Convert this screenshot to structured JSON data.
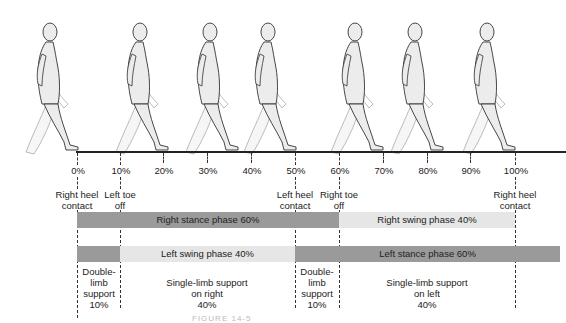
{
  "diagram": {
    "figure_count": 9,
    "timeline": {
      "ticks": [
        {
          "label": "0%",
          "x": 77
        },
        {
          "label": "10%",
          "x": 120
        },
        {
          "label": "20%",
          "x": 163
        },
        {
          "label": "30%",
          "x": 207
        },
        {
          "label": "40%",
          "x": 251
        },
        {
          "label": "50%",
          "x": 295
        },
        {
          "label": "60%",
          "x": 339
        },
        {
          "label": "70%",
          "x": 383
        },
        {
          "label": "80%",
          "x": 427
        },
        {
          "label": "90%",
          "x": 470
        },
        {
          "label": "100%",
          "x": 515
        }
      ]
    },
    "events": [
      {
        "line1": "Right heel",
        "line2": "contact",
        "at": "0%"
      },
      {
        "line1": "Left toe",
        "line2": "off",
        "at": "10%"
      },
      {
        "line1": "Left heel",
        "line2": "contact",
        "at": "50%"
      },
      {
        "line1": "Right toe",
        "line2": "off",
        "at": "60%"
      },
      {
        "line1": "Right heel",
        "line2": "contact",
        "at": "100%"
      }
    ],
    "phases": {
      "right_stance": "Right stance phase 60%",
      "right_swing": "Right swing phase 40%",
      "left_swing": "Left swing phase 40%",
      "left_stance": "Left stance phase 60%"
    },
    "support": [
      {
        "line1": "Double-",
        "line2": "limb",
        "line3": "support",
        "line4": "10%"
      },
      {
        "line1": "Single-limb support",
        "line2": "on right",
        "line3": "40%"
      },
      {
        "line1": "Double-",
        "line2": "limb",
        "line3": "support",
        "line4": "10%"
      },
      {
        "line1": "Single-limb support",
        "line2": "on left",
        "line3": "40%"
      }
    ],
    "colors": {
      "stance_bar": "#9a9a9a",
      "swing_bar": "#e6e6e6",
      "figure_fill": "#ececec",
      "figure_outline": "#333333"
    },
    "caption": "FIGURE 14-5"
  }
}
